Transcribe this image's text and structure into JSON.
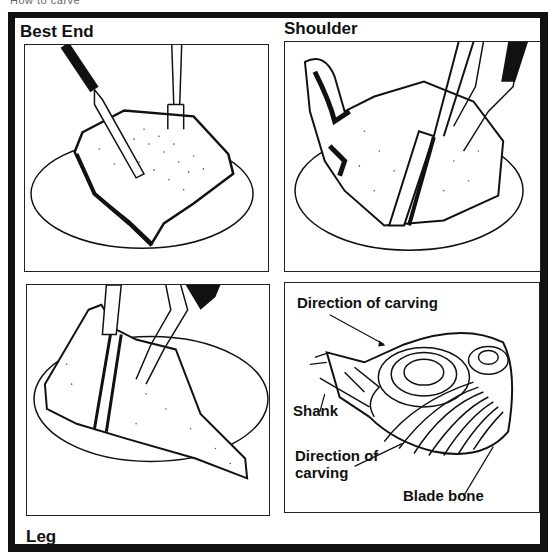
{
  "page": {
    "caption": "How to carve"
  },
  "panels": [
    {
      "id": "best-end",
      "label": "Best End"
    },
    {
      "id": "shoulder",
      "label": "Shoulder"
    },
    {
      "id": "leg",
      "label": "Leg"
    },
    {
      "id": "shoulder-diagram",
      "label": ""
    }
  ],
  "diagram": {
    "direction_top": "Direction of carving",
    "shank": "Shank",
    "direction_bottom_line1": "Direction of",
    "direction_bottom_line2": "carving",
    "blade_bone": "Blade bone"
  },
  "colors": {
    "ink": "#111111",
    "paper": "#ffffff"
  }
}
